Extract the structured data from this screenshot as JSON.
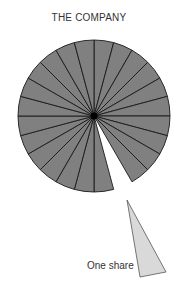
{
  "title": "THE COMPANY",
  "share_label": "One share",
  "pie": {
    "slices": 24,
    "missing_slice_index": 10,
    "fill": "#808080",
    "stroke": "#1a1a1a",
    "center_dot": "#000000"
  },
  "share": {
    "fill": "#d9d9d9",
    "stroke": "#555555"
  }
}
